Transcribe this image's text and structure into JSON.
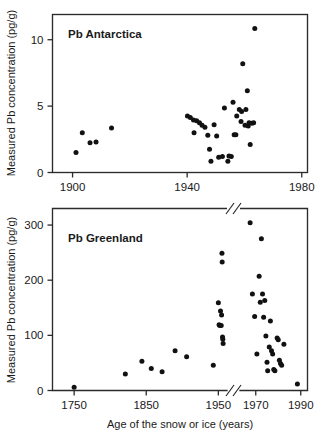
{
  "figure": {
    "width": 325,
    "height": 441,
    "background": "#ffffff",
    "ink_color": "#1a1a1a",
    "marker_color": "#111111"
  },
  "chart_data": [
    {
      "type": "scatter",
      "id": "antarctica",
      "title": "Pb Antarctica",
      "xlabel": "",
      "ylabel": "Measured Pb concentration (pg/g)",
      "xlim": [
        1893,
        1982
      ],
      "ylim": [
        0,
        11.9
      ],
      "xticks": [
        1900,
        1940,
        1980
      ],
      "xticklabels": [
        "1900",
        "1940",
        "1980"
      ],
      "yticks": [
        0,
        5,
        10
      ],
      "yticklabels": [
        "0",
        "5",
        "10"
      ],
      "grid": false,
      "legend": null,
      "axis_break": false,
      "points": [
        [
          1901.2,
          1.5
        ],
        [
          1903.4,
          3.0
        ],
        [
          1906.1,
          2.25
        ],
        [
          1908.2,
          2.3
        ],
        [
          1913.6,
          3.35
        ],
        [
          1940.1,
          4.25
        ],
        [
          1941.1,
          4.15
        ],
        [
          1942.2,
          3.95
        ],
        [
          1942.4,
          3.0
        ],
        [
          1943.3,
          3.9
        ],
        [
          1944.3,
          3.75
        ],
        [
          1945.2,
          3.55
        ],
        [
          1946.2,
          3.4
        ],
        [
          1947.2,
          2.8
        ],
        [
          1947.8,
          1.75
        ],
        [
          1948.3,
          0.85
        ],
        [
          1949.4,
          3.6
        ],
        [
          1950.3,
          2.75
        ],
        [
          1951.0,
          1.15
        ],
        [
          1952.3,
          1.2
        ],
        [
          1953.0,
          4.85
        ],
        [
          1954.2,
          0.85
        ],
        [
          1954.6,
          1.25
        ],
        [
          1955.4,
          1.2
        ],
        [
          1956.0,
          5.3
        ],
        [
          1956.4,
          2.85
        ],
        [
          1957.0,
          2.85
        ],
        [
          1957.3,
          4.25
        ],
        [
          1958.2,
          4.75
        ],
        [
          1958.8,
          3.85
        ],
        [
          1959.0,
          4.6
        ],
        [
          1959.4,
          8.2
        ],
        [
          1960.2,
          3.55
        ],
        [
          1960.5,
          4.75
        ],
        [
          1961.0,
          6.15
        ],
        [
          1961.3,
          3.5
        ],
        [
          1961.6,
          3.75
        ],
        [
          1962.0,
          2.1
        ],
        [
          1962.6,
          3.7
        ],
        [
          1963.2,
          3.75
        ],
        [
          1963.6,
          10.85
        ]
      ]
    },
    {
      "type": "scatter",
      "id": "greenland",
      "title": "Pb Greenland",
      "xlabel": "Age of the snow or ice (years)",
      "ylabel": "Measured Pb concentration (pg/g)",
      "ylim": [
        0,
        330
      ],
      "yticks": [
        0,
        100,
        200,
        300
      ],
      "yticklabels": [
        "0",
        "100",
        "200",
        "300"
      ],
      "xticks_left": [
        1750,
        1850,
        1950
      ],
      "xticklabels_left": [
        "1750",
        "1850",
        "1950"
      ],
      "xticks_right": [
        1970,
        1990
      ],
      "xticklabels_right": [
        "1970",
        "1990"
      ],
      "xlim_left": [
        1720,
        1962
      ],
      "xlim_right": [
        1963,
        1993
      ],
      "grid": false,
      "legend": null,
      "axis_break": true,
      "axis_break_note": "x-axis broken between 1950s and 1970",
      "points_left": [
        [
          1750,
          6
        ],
        [
          1821,
          30
        ],
        [
          1844,
          53
        ],
        [
          1857,
          40
        ],
        [
          1872,
          34
        ],
        [
          1890,
          72
        ],
        [
          1906,
          61
        ],
        [
          1943,
          46
        ],
        [
          1950,
          159
        ],
        [
          1951,
          119
        ],
        [
          1952,
          118
        ],
        [
          1953,
          144
        ],
        [
          1954,
          118
        ],
        [
          1954.5,
          137
        ],
        [
          1955,
          249
        ],
        [
          1955.3,
          233
        ],
        [
          1955.8,
          97
        ],
        [
          1956.2,
          93
        ],
        [
          1956.6,
          85
        ]
      ],
      "points_right": [
        [
          1967.5,
          304
        ],
        [
          1968.5,
          175
        ],
        [
          1969.5,
          134
        ],
        [
          1970.5,
          66
        ],
        [
          1971.5,
          207
        ],
        [
          1972.0,
          160
        ],
        [
          1972.5,
          275
        ],
        [
          1973.0,
          175
        ],
        [
          1973.5,
          133
        ],
        [
          1974.0,
          163
        ],
        [
          1974.5,
          99
        ],
        [
          1975.0,
          51
        ],
        [
          1975.3,
          36
        ],
        [
          1976.0,
          79
        ],
        [
          1976.5,
          126
        ],
        [
          1977.0,
          72
        ],
        [
          1977.5,
          66
        ],
        [
          1978.0,
          38
        ],
        [
          1978.5,
          36
        ],
        [
          1979.5,
          95
        ],
        [
          1980.0,
          92
        ],
        [
          1980.5,
          55
        ],
        [
          1981.0,
          49
        ],
        [
          1981.5,
          46
        ],
        [
          1982.5,
          84
        ],
        [
          1988.5,
          12
        ]
      ]
    }
  ]
}
